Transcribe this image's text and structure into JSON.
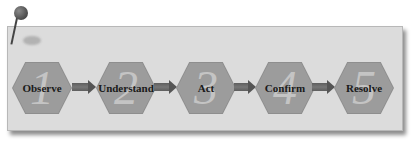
{
  "diagram": {
    "steps": [
      {
        "number": "1",
        "label": "Observe"
      },
      {
        "number": "2",
        "label": "Understand"
      },
      {
        "number": "3",
        "label": "Act"
      },
      {
        "number": "4",
        "label": "Confirm"
      },
      {
        "number": "5",
        "label": "Resolve"
      }
    ],
    "colors": {
      "card": "#dcdcdc",
      "hexagon": "#9c9c9c",
      "number": "#c4c4c4",
      "arrow": "#5e5e5e"
    }
  }
}
